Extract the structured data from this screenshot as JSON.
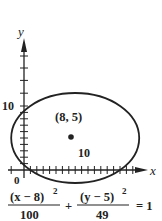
{
  "figure": {
    "type": "ellipse-graph",
    "axes": {
      "x_label": "x",
      "y_label": "y",
      "origin_label": "0",
      "x_tick_label": "10",
      "y_tick_label": "10"
    },
    "center": {
      "label": "(8, 5)",
      "x": 8,
      "y": 5
    },
    "ellipse": {
      "h": 8,
      "k": 5,
      "a": 10,
      "b": 7
    },
    "equation": {
      "term1_numerator": "(x − 8)",
      "term1_exponent": "2",
      "term1_denominator": "100",
      "plus": "+",
      "term2_numerator": "(y − 5)",
      "term2_exponent": "2",
      "term2_denominator": "49",
      "rhs": "= 1"
    },
    "colors": {
      "stroke": "#222222",
      "background": "#ffffff"
    }
  }
}
